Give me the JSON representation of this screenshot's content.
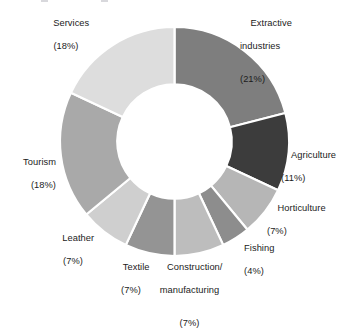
{
  "chart_data": {
    "type": "pie",
    "variant": "donut",
    "title": "",
    "xlabel": "",
    "ylabel": "",
    "units": "percent",
    "total": 100,
    "legend_position": "outside-labels",
    "grid": false,
    "start_angle_deg": 0,
    "direction": "clockwise",
    "inner_radius_ratio": 0.5,
    "categories": [
      "Extractive industries",
      "Agriculture",
      "Horticulture",
      "Fishing",
      "Construction/ manufacturing",
      "Textile",
      "Leather",
      "Tourism",
      "Services"
    ],
    "values": [
      21,
      11,
      7,
      4,
      7,
      7,
      7,
      18,
      18
    ],
    "colors": [
      "#7e7e7e",
      "#3c3c3c",
      "#b6b6b6",
      "#8d8d8d",
      "#bdbdbd",
      "#949494",
      "#cfcfcf",
      "#a9a9a9",
      "#dddddd"
    ],
    "slices": [
      {
        "label": "Extractive industries",
        "value": 21,
        "value_text": "(21%)",
        "color": "#7e7e7e",
        "label_lines": [
          "Extractive",
          "industries"
        ]
      },
      {
        "label": "Agriculture",
        "value": 11,
        "value_text": "(11%)",
        "color": "#3c3c3c",
        "label_lines": [
          "Agriculture"
        ]
      },
      {
        "label": "Horticulture",
        "value": 7,
        "value_text": "(7%)",
        "color": "#b6b6b6",
        "label_lines": [
          "Horticulture"
        ]
      },
      {
        "label": "Fishing",
        "value": 4,
        "value_text": "(4%)",
        "color": "#8d8d8d",
        "label_lines": [
          "Fishing"
        ]
      },
      {
        "label": "Construction/ manufacturing",
        "value": 7,
        "value_text": "(7%)",
        "color": "#bdbdbd",
        "label_lines": [
          "Construction/",
          "manufacturing"
        ]
      },
      {
        "label": "Textile",
        "value": 7,
        "value_text": "(7%)",
        "color": "#949494",
        "label_lines": [
          "Textile"
        ]
      },
      {
        "label": "Leather",
        "value": 7,
        "value_text": "(7%)",
        "color": "#cfcfcf",
        "label_lines": [
          "Leather"
        ]
      },
      {
        "label": "Tourism",
        "value": 18,
        "value_text": "(18%)",
        "color": "#a9a9a9",
        "label_lines": [
          "Tourism"
        ]
      },
      {
        "label": "Services",
        "value": 18,
        "value_text": "(18%)",
        "color": "#dddddd",
        "label_lines": [
          "Services"
        ]
      }
    ]
  },
  "labels": {
    "extractive_line1": "Extractive",
    "extractive_line2": "industries",
    "extractive_pct": "(21%)",
    "agriculture_name": "Agriculture",
    "agriculture_pct": "(11%)",
    "horticulture_name": "Horticulture",
    "horticulture_pct": "(7%)",
    "fishing_name": "Fishing",
    "fishing_pct": "(4%)",
    "construction_line1": "Construction/",
    "construction_line2": "manufacturing",
    "construction_pct": "(7%)",
    "textile_name": "Textile",
    "textile_pct": "(7%)",
    "leather_name": "Leather",
    "leather_pct": "(7%)",
    "tourism_name": "Tourism",
    "tourism_pct": "(18%)",
    "services_name": "Services",
    "services_pct": "(18%)"
  },
  "style": {
    "background": "#ffffff",
    "text_color": "#1b1b1b",
    "separator_color": "#ffffff"
  }
}
